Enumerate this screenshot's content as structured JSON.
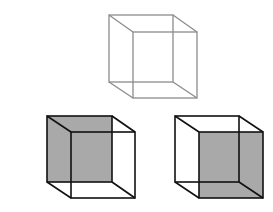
{
  "diagram": {
    "colors": {
      "background": "#ffffff",
      "ambiguous_stroke": "#8c8c8c",
      "interpretation_stroke": "#111111",
      "shaded_face": "#a9a9a9"
    },
    "cubes": [
      {
        "id": "ambiguous",
        "label": "Ambiguous wireframe cube",
        "back": [
          109,
          15,
          64,
          67
        ],
        "front": [
          133,
          32,
          64,
          66
        ],
        "shaded": "none"
      },
      {
        "id": "interpretation-a",
        "label": "Cube viewed with back-left face shaded",
        "back": [
          47,
          116,
          65,
          66
        ],
        "front": [
          71,
          132,
          64,
          66
        ],
        "shaded": "back"
      },
      {
        "id": "interpretation-b",
        "label": "Cube viewed with front-right face shaded",
        "back": [
          175,
          116,
          64,
          66
        ],
        "front": [
          199,
          132,
          64,
          66
        ],
        "shaded": "front"
      }
    ]
  }
}
